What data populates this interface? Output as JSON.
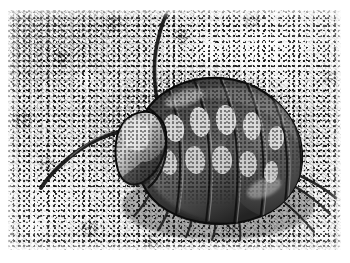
{
  "page": {
    "kind": "scanned-photograph",
    "background_color": "#ffffff",
    "width": 350,
    "height": 263
  },
  "photo": {
    "subject_name": "woodlouse",
    "subject_alt": "Black and white photograph of a woodlouse (pill bug isopod) crawling over coarse gravel",
    "style": "halftone print scan, grayscale, high grain",
    "orientation": "landscape",
    "plate": {
      "left": 8,
      "top": 10,
      "width": 333,
      "height": 240,
      "border_color": "#ffffff"
    },
    "tones": {
      "paper_white": "#ffffff",
      "gravel_light": "#e8e8e8",
      "gravel_mid": "#bdbdbd",
      "gravel_dark": "#303030",
      "body_shell_dark": "#3a3a3a",
      "body_shell_mid": "#6e6e6e",
      "body_highlight": "#e6e6e6",
      "outline_black": "#101010"
    },
    "background_description": "coarse speckled gravel / concrete, strongly dithered light and dark grains",
    "subject": {
      "species_hint": "Porcellio scaber",
      "pose": "walking diagonally, head to lower-left, rear to upper-right",
      "body_segments": 7,
      "pale_spot_rows": 2,
      "pale_spots_per_row": 5,
      "antennae": 2,
      "uropods": 2,
      "visible_legs": 6
    }
  }
}
